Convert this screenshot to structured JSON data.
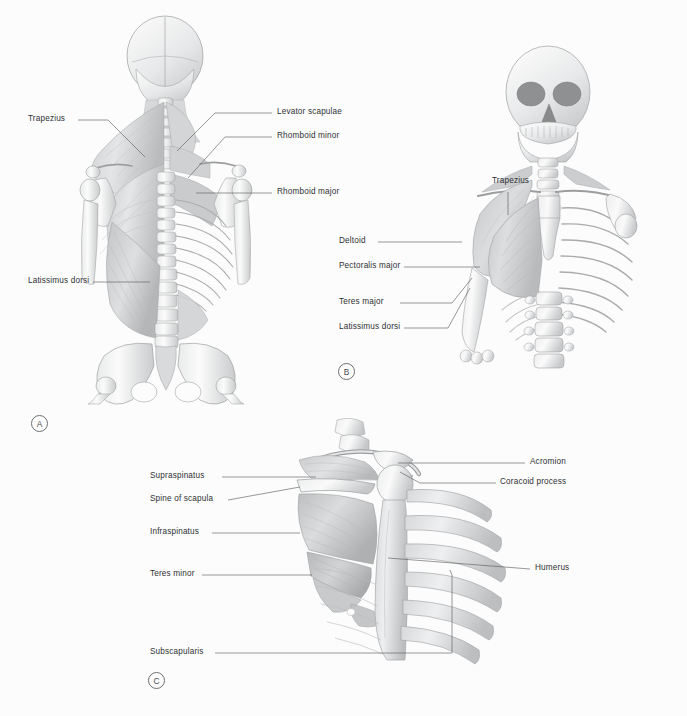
{
  "plate": {
    "background_color": "#fcfcfc",
    "label_color": "#2f3133",
    "leader_color": "#58595b",
    "width": 687,
    "height": 716
  },
  "panels": [
    {
      "marker": "A",
      "view": "posterior-trunk-superficial-and-deep-back-muscles",
      "labels": [
        {
          "text": "Trapezius",
          "side": "left"
        },
        {
          "text": "Latissimus dorsi",
          "side": "left"
        },
        {
          "text": "Levator scapulae",
          "side": "right"
        },
        {
          "text": "Rhomboid minor",
          "side": "right"
        },
        {
          "text": "Rhomboid major",
          "side": "right"
        }
      ]
    },
    {
      "marker": "B",
      "view": "anterior-thorax-pectoral-region",
      "labels": [
        {
          "text": "Trapezius",
          "side": "top"
        },
        {
          "text": "Deltoid",
          "side": "left"
        },
        {
          "text": "Pectoralis major",
          "side": "left"
        },
        {
          "text": "Teres major",
          "side": "left"
        },
        {
          "text": "Latissimus dorsi",
          "side": "left"
        }
      ]
    },
    {
      "marker": "C",
      "view": "lateral-scapula-rotator-cuff",
      "labels": [
        {
          "text": "Supraspinatus",
          "side": "left"
        },
        {
          "text": "Spine of scapula",
          "side": "left"
        },
        {
          "text": "Infraspinatus",
          "side": "left"
        },
        {
          "text": "Teres minor",
          "side": "left"
        },
        {
          "text": "Subscapularis",
          "side": "left"
        },
        {
          "text": "Acromion",
          "side": "right"
        },
        {
          "text": "Coracoid process",
          "side": "right"
        },
        {
          "text": "Humerus",
          "side": "right"
        }
      ]
    }
  ],
  "labels_flat": {
    "a_trapezius": "Trapezius",
    "a_latissimus_dorsi": "Latissimus dorsi",
    "a_levator_scapulae": "Levator scapulae",
    "a_rhomboid_minor": "Rhomboid minor",
    "a_rhomboid_major": "Rhomboid major",
    "b_trapezius": "Trapezius",
    "b_deltoid": "Deltoid",
    "b_pectoralis_major": "Pectoralis major",
    "b_teres_major": "Teres major",
    "b_latissimus_dorsi": "Latissimus dorsi",
    "c_supraspinatus": "Supraspinatus",
    "c_spine_of_scapula": "Spine of scapula",
    "c_infraspinatus": "Infraspinatus",
    "c_teres_minor": "Teres minor",
    "c_subscapularis": "Subscapularis",
    "c_acromion": "Acromion",
    "c_coracoid_process": "Coracoid process",
    "c_humerus": "Humerus"
  },
  "markers": {
    "a": "A",
    "b": "B",
    "c": "C"
  }
}
